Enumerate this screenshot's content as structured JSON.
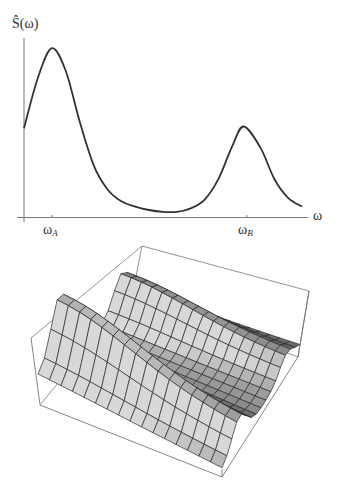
{
  "chart_data": [
    {
      "type": "line",
      "title": "",
      "ylabel": "Ŝ(ω)",
      "xlabel": "ω",
      "x_ticks": [
        {
          "label": "ω",
          "sub": "A",
          "position": 0.1
        },
        {
          "label": "ω",
          "sub": "B",
          "position": 0.79
        }
      ],
      "grid": false,
      "legend": null,
      "series": [
        {
          "name": "Ŝ(ω)",
          "x": [
            0.0,
            0.05,
            0.1,
            0.15,
            0.2,
            0.25,
            0.3,
            0.35,
            0.4,
            0.45,
            0.5,
            0.55,
            0.6,
            0.65,
            0.7,
            0.75,
            0.79,
            0.85,
            0.9,
            0.95,
            1.0
          ],
          "y": [
            0.51,
            0.8,
            0.97,
            0.84,
            0.55,
            0.3,
            0.16,
            0.09,
            0.06,
            0.04,
            0.03,
            0.03,
            0.05,
            0.1,
            0.22,
            0.41,
            0.52,
            0.4,
            0.22,
            0.11,
            0.06
          ]
        }
      ],
      "xlim": [
        0,
        1
      ],
      "ylim": [
        0,
        1
      ],
      "annotations": [
        "two peaks at ω_A (larger) and ω_B (smaller)"
      ]
    },
    {
      "type": "surface",
      "title": "",
      "description": "3D wireframe-shaded surface with two ridges corresponding to ω_A and ω_B, enclosed in a bounding box",
      "grid_resolution": [
        16,
        16
      ],
      "peaks": [
        {
          "name": "A",
          "center_t": 0.78,
          "height": 0.95,
          "width": 0.09
        },
        {
          "name": "B",
          "center_t": 0.17,
          "height": 0.55,
          "width": 0.09
        }
      ]
    }
  ],
  "labels": {
    "y_axis": "Ŝ(ω)",
    "x_axis": "ω",
    "tick_a_main": "ω",
    "tick_a_sub": "A",
    "tick_b_main": "ω",
    "tick_b_sub": "B"
  },
  "colors": {
    "line": "#333333",
    "axis": "#555555",
    "box": "#777777",
    "mesh": "#2a2a2a"
  }
}
